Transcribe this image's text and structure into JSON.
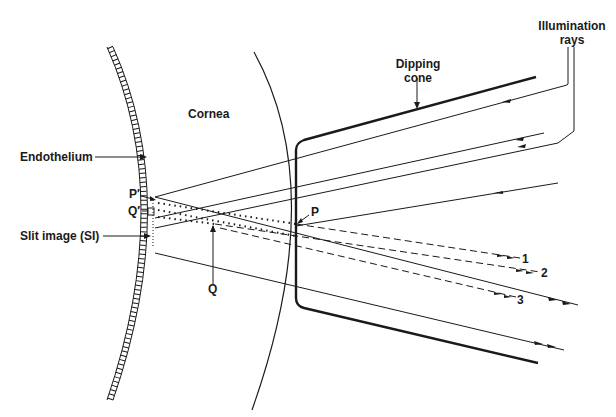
{
  "labels": {
    "cornea": "Cornea",
    "endothelium": "Endothelium",
    "p_prime": "P′",
    "q_prime": "Q′",
    "slit_image": "Slit image (SI)",
    "q": "Q",
    "p": "P",
    "dipping_cone_line1": "Dipping",
    "dipping_cone_line2": "cone",
    "illumination_line1": "Illumination",
    "illumination_line2": "rays",
    "ray1": "1",
    "ray2": "2",
    "ray3": "3"
  },
  "colors": {
    "ink": "#1a1a1a",
    "background": "#ffffff"
  }
}
